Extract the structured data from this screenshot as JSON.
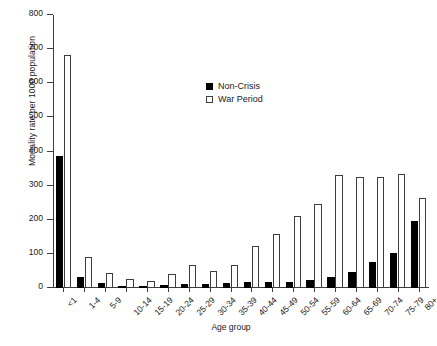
{
  "chart_data": {
    "type": "bar",
    "title": "",
    "xlabel": "Age group",
    "ylabel": "Mortality rate per 1000 population",
    "ylim": [
      0,
      800
    ],
    "yticks": [
      0,
      100,
      200,
      300,
      400,
      500,
      600,
      700,
      800
    ],
    "grid": false,
    "legend_position": "upper center",
    "categories": [
      "<1",
      "1-4",
      "5-9",
      "10-14",
      "15-19",
      "20-24",
      "25-29",
      "30-34",
      "35-39",
      "40-44",
      "45-49",
      "50-54",
      "55-59",
      "60-64",
      "65-69",
      "70-74",
      "75-79",
      "80+"
    ],
    "series": [
      {
        "name": "Non-Crisis",
        "color": "#000000",
        "values": [
          387,
          32,
          14,
          7,
          6,
          9,
          12,
          12,
          14,
          17,
          18,
          19,
          24,
          32,
          47,
          76,
          104,
          196
        ]
      },
      {
        "name": "War Period",
        "color": "#ffffff",
        "values": [
          682,
          91,
          45,
          27,
          22,
          41,
          66,
          51,
          66,
          124,
          157,
          212,
          245,
          330,
          325,
          325,
          333,
          264
        ]
      }
    ]
  },
  "legend": {
    "items": [
      {
        "label": "Non-Crisis",
        "swatch": "filled-square"
      },
      {
        "label": "War Period",
        "swatch": "open-square"
      }
    ]
  },
  "axes": {
    "y_title": "Mortality rate per 1000 population",
    "x_title": "Age group"
  }
}
